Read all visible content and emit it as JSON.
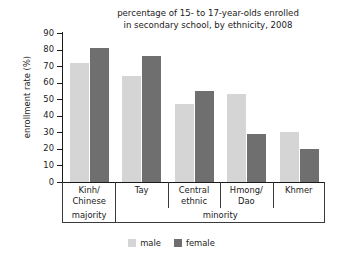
{
  "chart_data": {
    "type": "bar",
    "title": "percentage of 15- to 17-year-olds enrolled in secondary school, by ethnicity, 2008",
    "title_lines": [
      "percentage of 15- to 17-year-olds enrolled",
      "in secondary school, by ethnicity, 2008"
    ],
    "xlabel": "",
    "ylabel": "enrollment rate (%)",
    "ylim": [
      0,
      90
    ],
    "ytick_step": 10,
    "yticks": [
      90,
      80,
      70,
      60,
      50,
      40,
      30,
      20,
      10,
      0
    ],
    "grid": false,
    "legend_position": "bottom",
    "categories": [
      "Kinh/ Chinese",
      "Tay",
      "Central ethnic",
      "Hmong/ Dao",
      "Khmer"
    ],
    "category_lines": [
      [
        "Kinh/",
        "Chinese"
      ],
      [
        "Tay",
        ""
      ],
      [
        "Central",
        "ethnic"
      ],
      [
        "Hmong/",
        "Dao"
      ],
      [
        "Khmer",
        ""
      ]
    ],
    "groupings": [
      {
        "label": "majority",
        "categories": [
          "Kinh/ Chinese"
        ]
      },
      {
        "label": "minority",
        "categories": [
          "Tay",
          "Central ethnic",
          "Hmong/ Dao",
          "Khmer"
        ]
      }
    ],
    "series": [
      {
        "name": "male",
        "color": "#d5d5d5",
        "values": [
          72,
          64,
          47,
          53,
          30
        ]
      },
      {
        "name": "female",
        "color": "#6f6f6f",
        "values": [
          81,
          76,
          55,
          29,
          20
        ]
      }
    ]
  },
  "legend": {
    "items": [
      {
        "label": "male"
      },
      {
        "label": "female"
      }
    ]
  },
  "colors": {
    "male": "#d5d5d5",
    "female": "#6f6f6f",
    "axis": "#1a1a1a",
    "background": "#ffffff"
  }
}
